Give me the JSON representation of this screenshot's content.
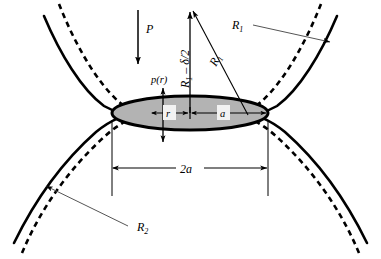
{
  "figure": {
    "type": "hertzian-contact-diagram",
    "background_color": "#ffffff",
    "line_color": "#000000",
    "leader_color": "#555555",
    "contact_patch_fill": "#b3b3b3",
    "contact_patch_stroke": "#000000"
  },
  "labels": {
    "load": "P",
    "pressure": "p(r)",
    "radius_upper_leader": "R",
    "radius_upper_leader_sub": "1",
    "radius_lower_leader": "R",
    "radius_lower_leader_sub": "2",
    "approach": "R",
    "approach_sub": "1",
    "approach_rest": " – δ/2",
    "radius_arrow": "R",
    "radius_arrow_sub": "1",
    "radial_coord": "r",
    "contact_radius": "a",
    "contact_diameter": "2a"
  },
  "geometry": {
    "contact_center_x": 190,
    "contact_center_y": 113,
    "contact_rx": 78,
    "contact_ry": 17,
    "dashed_outer_rx": 88,
    "dashed_outer_ry": 27,
    "dimension_line_y": 168,
    "dimension_left_x": 112,
    "dimension_right_x": 268,
    "extension_top_y": 120,
    "extension_bottom_y": 196,
    "load_arrow_x": 138,
    "load_arrow_top_y": 10,
    "load_arrow_bottom_y": 62,
    "vertical_arrow_x": 190,
    "vertical_arrow_top_y": 14,
    "vertical_arrow_bottom_y": 113,
    "diagonal_arrow_x1": 248,
    "diagonal_arrow_y1": 113,
    "diagonal_arrow_x2": 193,
    "diagonal_arrow_y2": 8,
    "pressure_arrow_x": 163,
    "pressure_arrow_up_y": 89,
    "pressure_arrow_down_y": 140
  }
}
